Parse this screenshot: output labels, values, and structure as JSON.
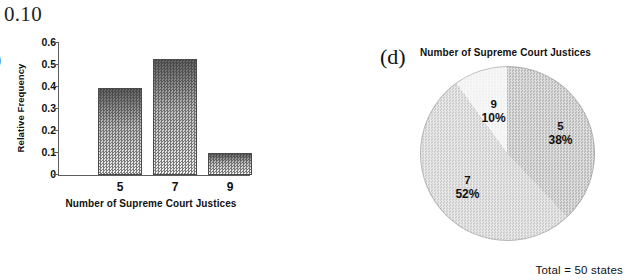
{
  "stray_text": "0.10",
  "bar_panel": {
    "panel_label": ")",
    "y_axis_title": "Relative Frequency",
    "x_axis_title": "Number of Supreme Court Justices",
    "y_ticks": [
      "0.6",
      "0.5",
      "0.4",
      "0.3",
      "0.2",
      "0.1",
      "0"
    ]
  },
  "pie_panel": {
    "panel_label": "(d)",
    "title": "Number of Supreme Court Justices",
    "total_note": "Total = 50 states",
    "labels": [
      {
        "category": "5",
        "percent": "38%"
      },
      {
        "category": "7",
        "percent": "52%"
      },
      {
        "category": "9",
        "percent": "10%"
      }
    ]
  },
  "colors": {
    "slice_5": "#b9b9b9",
    "slice_7": "#cdcdcd",
    "slice_9": "#f0f0f0",
    "bar_fill_top": "#606060",
    "bar_fill_bottom": "#dcdcdc",
    "axis": "#5d5d5d",
    "text": "#111111",
    "background": "#ffffff"
  },
  "chart_data": [
    {
      "type": "bar",
      "title": "",
      "xlabel": "Number of Supreme Court Justices",
      "ylabel": "Relative Frequency",
      "categories": [
        "5",
        "7",
        "9"
      ],
      "values": [
        0.39,
        0.52,
        0.1
      ],
      "ylim": [
        0,
        0.6
      ],
      "yticks": [
        0,
        0.1,
        0.2,
        0.3,
        0.4,
        0.5,
        0.6
      ],
      "grid": false,
      "legend": "none"
    },
    {
      "type": "pie",
      "title": "Number of Supreme Court Justices",
      "annotation": "Total = 50 states",
      "categories": [
        "5",
        "7",
        "9"
      ],
      "values": [
        38,
        52,
        10
      ],
      "value_labels": [
        "38%",
        "52%",
        "10%"
      ],
      "start_angle_deg": 0,
      "direction": "clockwise",
      "legend": "none"
    }
  ]
}
